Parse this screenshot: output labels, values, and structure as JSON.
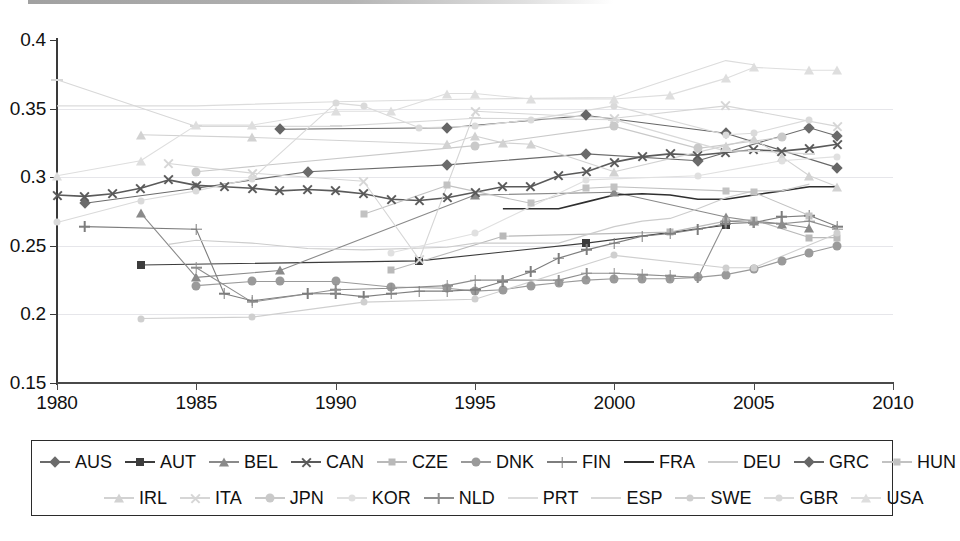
{
  "chart_data": {
    "type": "line",
    "title": "",
    "subtitle": "",
    "xlabel": "",
    "ylabel": "",
    "xlim": [
      1980,
      2010
    ],
    "ylim": [
      0.15,
      0.4
    ],
    "xticks": [
      "1980",
      "1985",
      "1990",
      "1995",
      "2000",
      "2005",
      "2010"
    ],
    "yticks": [
      "0.4",
      "0.35",
      "0.3",
      "0.25",
      "0.2",
      "0.15"
    ],
    "ytick_values": [
      0.4,
      0.35,
      0.3,
      0.25,
      0.2,
      0.15
    ],
    "xtick_values": [
      1980,
      1985,
      1990,
      1995,
      2000,
      2005,
      2010
    ],
    "grid": "horizontal",
    "legend_position": "bottom",
    "legend_rows": [
      [
        "AUS",
        "AUT",
        "BEL",
        "CAN",
        "CZE",
        "DNK",
        "FIN",
        "FRA",
        "DEU",
        "GRC",
        "HUN"
      ],
      [
        "IRL",
        "ITA",
        "JPN",
        "KOR",
        "NLD",
        "PRT",
        "ESP",
        "SWE",
        "GBR",
        "USA"
      ]
    ],
    "series": [
      {
        "name": "AUS",
        "marker": "diamond",
        "color": "#6b6b6b",
        "x": [
          1981,
          1985,
          1989,
          1994,
          1999,
          2003,
          2007,
          2008
        ],
        "values": [
          0.281,
          0.292,
          0.304,
          0.309,
          0.317,
          0.312,
          0.336,
          0.33
        ]
      },
      {
        "name": "AUT",
        "marker": "square",
        "color": "#3c3c3c",
        "x": [
          1983,
          1993,
          1999,
          2004
        ],
        "values": [
          0.236,
          0.239,
          0.252,
          0.265
        ]
      },
      {
        "name": "BEL",
        "marker": "triangle",
        "color": "#8a8a8a",
        "x": [
          1983,
          1985,
          1988,
          1995,
          2000,
          2004,
          2005,
          2006,
          2007
        ],
        "values": [
          0.274,
          0.227,
          0.232,
          0.287,
          0.289,
          0.271,
          0.268,
          0.266,
          0.263
        ]
      },
      {
        "name": "CAN",
        "marker": "x",
        "color": "#5a5a5a",
        "x": [
          1980,
          1981,
          1982,
          1983,
          1984,
          1985,
          1986,
          1987,
          1988,
          1989,
          1990,
          1991,
          1992,
          1993,
          1994,
          1995,
          1996,
          1997,
          1998,
          1999,
          2000,
          2001,
          2002,
          2003,
          2004,
          2005,
          2006,
          2007,
          2008
        ],
        "values": [
          0.287,
          0.286,
          0.288,
          0.292,
          0.298,
          0.294,
          0.293,
          0.292,
          0.29,
          0.291,
          0.29,
          0.288,
          0.284,
          0.283,
          0.285,
          0.289,
          0.293,
          0.293,
          0.301,
          0.304,
          0.311,
          0.315,
          0.317,
          0.316,
          0.318,
          0.32,
          0.319,
          0.321,
          0.324
        ]
      },
      {
        "name": "CZE",
        "marker": "small-square",
        "color": "#b9b9b9",
        "x": [
          1992,
          1996,
          2002,
          2004,
          2005,
          2007,
          2008
        ],
        "values": [
          0.232,
          0.257,
          0.26,
          0.268,
          0.269,
          0.256,
          0.256
        ]
      },
      {
        "name": "DNK",
        "marker": "circle",
        "color": "#9a9a9a",
        "x": [
          1985,
          1987,
          1988,
          1990,
          1992,
          1994,
          1995,
          1996,
          1997,
          1998,
          1999,
          2000,
          2001,
          2002,
          2003,
          2004,
          2005,
          2006,
          2007,
          2008
        ],
        "values": [
          0.221,
          0.224,
          0.224,
          0.224,
          0.22,
          0.219,
          0.217,
          0.218,
          0.221,
          0.223,
          0.225,
          0.226,
          0.226,
          0.226,
          0.227,
          0.229,
          0.233,
          0.239,
          0.245,
          0.25
        ]
      },
      {
        "name": "FIN",
        "marker": "plus",
        "color": "#7d7d7d",
        "x": [
          1981,
          1985,
          1986,
          1987,
          1989,
          1990,
          1991,
          1992,
          1993,
          1994,
          1995,
          1996,
          1997,
          1998,
          1999,
          2000,
          2001,
          2002,
          2003,
          2004,
          2005,
          2006,
          2007,
          2008
        ],
        "values": [
          0.264,
          0.262,
          0.215,
          0.21,
          0.215,
          0.215,
          0.213,
          0.215,
          0.217,
          0.217,
          0.218,
          0.224,
          0.231,
          0.241,
          0.247,
          0.252,
          0.257,
          0.259,
          0.262,
          0.266,
          0.267,
          0.271,
          0.272,
          0.264
        ]
      },
      {
        "name": "FRA",
        "marker": "line",
        "color": "#2f2f2f",
        "x": [
          1996,
          1997,
          1998,
          1999,
          2000,
          2001,
          2002,
          2003,
          2004,
          2005,
          2006,
          2007,
          2008
        ],
        "values": [
          0.277,
          0.277,
          0.277,
          0.282,
          0.287,
          0.288,
          0.287,
          0.284,
          0.284,
          0.287,
          0.29,
          0.293,
          0.293
        ]
      },
      {
        "name": "DEU",
        "marker": "none",
        "color": "#cccccc",
        "x": [
          1984,
          1985,
          1987,
          1989,
          1991,
          1994,
          1995,
          1998,
          2000,
          2001,
          2002,
          2003,
          2004,
          2005,
          2006,
          2007
        ],
        "values": [
          0.251,
          0.254,
          0.252,
          0.248,
          0.247,
          0.249,
          0.252,
          0.252,
          0.264,
          0.268,
          0.27,
          0.277,
          0.285,
          0.29,
          0.29,
          0.295
        ]
      },
      {
        "name": "GRC",
        "marker": "diamond",
        "color": "#666666",
        "x": [
          1988,
          1994,
          1999,
          2004,
          2008
        ],
        "values": [
          0.335,
          0.336,
          0.345,
          0.332,
          0.307
        ]
      },
      {
        "name": "HUN",
        "marker": "small-square",
        "color": "#c2c2c2",
        "x": [
          1991,
          1994,
          1997,
          1999,
          2000,
          2004,
          2005,
          2007
        ],
        "values": [
          0.273,
          0.294,
          0.281,
          0.292,
          0.293,
          0.29,
          0.289,
          0.272
        ]
      },
      {
        "name": "IRL",
        "marker": "triangle",
        "color": "#d2d2d2",
        "x": [
          1983,
          1987,
          1994,
          1995,
          1996,
          1997,
          2000,
          2004,
          2005,
          2006,
          2007,
          2008
        ],
        "values": [
          0.331,
          0.329,
          0.324,
          0.33,
          0.325,
          0.324,
          0.304,
          0.323,
          0.328,
          0.315,
          0.301,
          0.293
        ]
      },
      {
        "name": "ITA",
        "marker": "x",
        "color": "#d6d6d6",
        "x": [
          1984,
          1987,
          1991,
          1993,
          1995,
          2000,
          2004,
          2008
        ],
        "values": [
          0.31,
          0.303,
          0.297,
          0.24,
          0.348,
          0.343,
          0.352,
          0.337
        ]
      },
      {
        "name": "JPN",
        "marker": "circle",
        "color": "#c9c9c9",
        "x": [
          1985,
          1995,
          2000,
          2003,
          2006
        ],
        "values": [
          0.304,
          0.323,
          0.337,
          0.321,
          0.329
        ]
      },
      {
        "name": "KOR",
        "marker": "dot",
        "color": "#e0e0e0",
        "x": [
          1992,
          1995,
          1999,
          2003,
          2006,
          2008
        ],
        "values": [
          0.245,
          0.259,
          0.298,
          0.301,
          0.312,
          0.315
        ]
      },
      {
        "name": "NLD",
        "marker": "plus",
        "color": "#8e8e8e",
        "x": [
          1985,
          1987,
          1990,
          1992,
          1994,
          1995,
          1996,
          1998,
          1999,
          2000,
          2001,
          2002,
          2003,
          2004,
          2005,
          2006,
          2007,
          2008
        ],
        "values": [
          0.234,
          0.209,
          0.218,
          0.219,
          0.221,
          0.225,
          0.225,
          0.225,
          0.23,
          0.23,
          0.229,
          0.228,
          0.227,
          0.268,
          0.267,
          0.266,
          0.268,
          0.262
        ]
      },
      {
        "name": "PRT",
        "marker": "none",
        "color": "#dcdcdc",
        "x": [
          1980,
          1985,
          1990,
          1995,
          2000,
          2004,
          2005
        ],
        "values": [
          0.352,
          0.352,
          0.355,
          0.357,
          0.358,
          0.385,
          0.382
        ]
      },
      {
        "name": "ESP",
        "marker": "dash",
        "color": "#d8d8d8",
        "x": [
          1980,
          1985,
          1990,
          1995,
          2000,
          2004,
          2005,
          2007
        ],
        "values": [
          0.371,
          0.337,
          0.337,
          0.343,
          0.342,
          0.319,
          0.319,
          0.317
        ]
      },
      {
        "name": "SWE",
        "marker": "dot",
        "color": "#cfcfcf",
        "x": [
          1983,
          1987,
          1991,
          1995,
          2000,
          2004,
          2005,
          2008
        ],
        "values": [
          0.197,
          0.198,
          0.209,
          0.211,
          0.243,
          0.234,
          0.234,
          0.259
        ]
      },
      {
        "name": "GBR",
        "marker": "dot",
        "color": "#dadada",
        "x": [
          1980,
          1983,
          1985,
          1987,
          1990,
          1991,
          1993,
          1995,
          1997,
          2000,
          2004,
          2005,
          2007
        ],
        "values": [
          0.267,
          0.283,
          0.29,
          0.299,
          0.354,
          0.352,
          0.336,
          0.337,
          0.342,
          0.352,
          0.331,
          0.332,
          0.342
        ]
      },
      {
        "name": "USA",
        "marker": "triangle",
        "color": "#dedede",
        "x": [
          1980,
          1983,
          1985,
          1987,
          1990,
          1992,
          1994,
          1995,
          1997,
          2000,
          2002,
          2004,
          2005,
          2007,
          2008
        ],
        "values": [
          0.301,
          0.312,
          0.338,
          0.338,
          0.348,
          0.348,
          0.361,
          0.361,
          0.357,
          0.357,
          0.36,
          0.372,
          0.38,
          0.378,
          0.378
        ]
      }
    ]
  }
}
